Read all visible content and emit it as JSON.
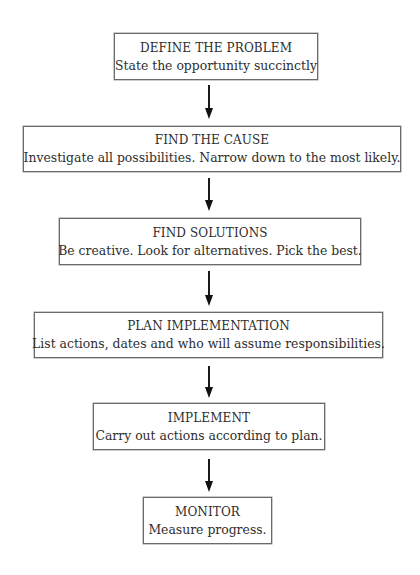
{
  "diagram": {
    "type": "flowchart",
    "direction": "top-to-bottom",
    "steps": [
      {
        "title": "DEFINE THE PROBLEM",
        "description": "State the opportunity succinctly"
      },
      {
        "title": "FIND THE CAUSE",
        "description": "Investigate all possibilities. Narrow down to the most likely."
      },
      {
        "title": "FIND SOLUTIONS",
        "description": "Be creative. Look for alternatives. Pick the best."
      },
      {
        "title": "PLAN IMPLEMENTATION",
        "description": "List actions, dates and who will assume responsibilities."
      },
      {
        "title": "IMPLEMENT",
        "description": "Carry out actions according to plan."
      },
      {
        "title": "MONITOR",
        "description": "Measure progress."
      }
    ],
    "connectors": [
      {
        "from": 0,
        "to": 1,
        "icon": "arrow-down-icon"
      },
      {
        "from": 1,
        "to": 2,
        "icon": "arrow-down-icon"
      },
      {
        "from": 2,
        "to": 3,
        "icon": "arrow-down-icon"
      },
      {
        "from": 3,
        "to": 4,
        "icon": "arrow-down-icon"
      },
      {
        "from": 4,
        "to": 5,
        "icon": "arrow-down-icon"
      }
    ],
    "colors": {
      "text": "#2e2e2e",
      "border": "#6a6a6a",
      "arrow": "#111111",
      "background": "#ffffff"
    }
  }
}
